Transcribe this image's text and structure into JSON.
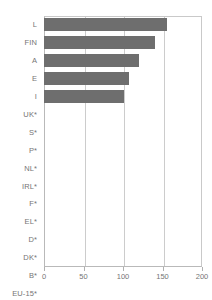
{
  "chart_data": {
    "type": "bar",
    "orientation": "horizontal",
    "title": "",
    "xlabel": "",
    "ylabel": "",
    "xlim": [
      0,
      200
    ],
    "ylim": null,
    "grid": true,
    "legend": null,
    "xticks": [
      0,
      50,
      100,
      150,
      200
    ],
    "xtick_labels": [
      "0",
      "50",
      "100",
      "150",
      "200"
    ],
    "categories": [
      "L",
      "FIN",
      "A",
      "E",
      "I",
      "UK*",
      "S*",
      "P*",
      "NL*",
      "IRL*",
      "F*",
      "EL*",
      "D*",
      "DK*",
      "B*",
      "EU-15*"
    ],
    "values": [
      156,
      140,
      120,
      108,
      101,
      0,
      0,
      0,
      0,
      0,
      0,
      0,
      0,
      0,
      0,
      0
    ],
    "bar_color": "#6e6e6e",
    "series": [
      {
        "name": "",
        "values": [
          156,
          140,
          120,
          108,
          101,
          0,
          0,
          0,
          0,
          0,
          0,
          0,
          0,
          0,
          0,
          0
        ]
      }
    ]
  },
  "axes": {
    "grid_color": "#cccccc",
    "axis_color": "#b9b9b9",
    "tick_label_color": "#757575"
  }
}
